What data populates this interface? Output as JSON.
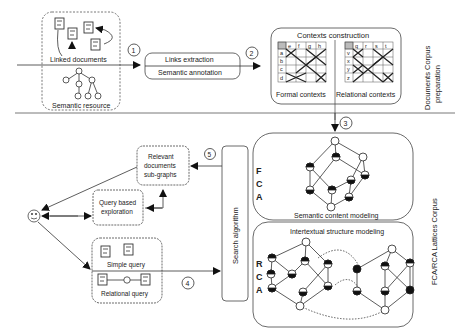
{
  "sections": {
    "top_label_line1": "Documents Corpus",
    "top_label_line2": "preparation",
    "bottom_label": "FCA/RCA  Lattices Corpus"
  },
  "corpus": {
    "linked_documents": "Linked documents",
    "semantic_resource": "Semantic resource"
  },
  "steps": {
    "s1": "1",
    "s2": "2",
    "s3": "3",
    "s4": "4",
    "s5": "5"
  },
  "processing": {
    "links_extraction": "Links extraction",
    "semantic_annotation": "Semantic annotation"
  },
  "contexts": {
    "title": "Contexts construction",
    "formal": {
      "label": "Formal contexts",
      "columns": [
        "e",
        "f",
        "g",
        "h"
      ],
      "rows": [
        "a",
        "b",
        "c",
        "d"
      ]
    },
    "relational": {
      "label": "Relational contexts",
      "columns": [
        "q",
        "r",
        "s",
        "t"
      ],
      "rows": [
        "v",
        "x",
        "y",
        "z"
      ]
    }
  },
  "lattices": {
    "fca_letters": [
      "F",
      "C",
      "A"
    ],
    "rca_letters": [
      "R",
      "C",
      "A"
    ],
    "semantic_content": "Semantic content modeling",
    "intertextual": "Intertextual structure modeling"
  },
  "search": {
    "label": "Search algorithm"
  },
  "user": {
    "relevant_line1": "Relevant",
    "relevant_line2": "documents",
    "relevant_line3": "sub-graphs",
    "query_line1": "Query based",
    "query_line2": "exploration",
    "simple_query": "Simple query",
    "relational_query": "Relational query"
  }
}
